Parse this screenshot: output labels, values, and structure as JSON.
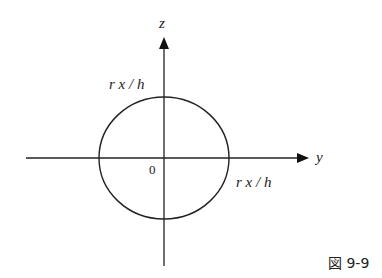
{
  "diagram": {
    "axes": {
      "vertical_label": "z",
      "horizontal_label": "y",
      "origin_label": "0"
    },
    "circle": {
      "top_radius_label": "r x / h",
      "right_radius_label": "r x / h"
    },
    "caption": "図 9-9",
    "colors": {
      "stroke": "#222222",
      "background": "#ffffff"
    }
  }
}
